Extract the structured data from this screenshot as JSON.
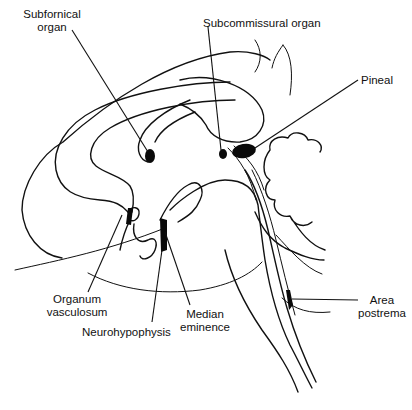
{
  "figure": {
    "type": "anatomical-line-drawing",
    "ink_color": "#111111",
    "background": "#ffffff"
  },
  "labels": [
    {
      "id": "subfornical",
      "lines": [
        "Subfornical",
        "organ"
      ]
    },
    {
      "id": "subcommissural",
      "lines": [
        "Subcommissural organ"
      ]
    },
    {
      "id": "pineal",
      "lines": [
        "Pineal"
      ]
    },
    {
      "id": "organum",
      "lines": [
        "Organum",
        "vasculosum"
      ]
    },
    {
      "id": "neurohypophysis",
      "lines": [
        "Neurohypophysis"
      ]
    },
    {
      "id": "median",
      "lines": [
        "Median",
        "eminence"
      ]
    },
    {
      "id": "area",
      "lines": [
        "Area",
        "postrema"
      ]
    }
  ]
}
